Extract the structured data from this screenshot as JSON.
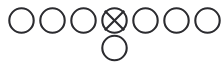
{
  "diagram": {
    "background_color": "#ffffff",
    "stroke_color": "#2b2b2f",
    "fill_color": "#ffffff",
    "stroke_width": 2.1,
    "canvas": {
      "width": 224,
      "height": 75
    },
    "layout": {
      "row_count": 2,
      "top_row_count": 7,
      "bottom_row_count": 1,
      "circle_radius": 12.2,
      "horizontal_pitch": 31,
      "top_row_center_y": 20.5,
      "bottom_row_center_y": 48,
      "first_center_x": 21.5
    },
    "nodes": [
      {
        "id": "n1",
        "label": "",
        "mark": "none",
        "row": "top",
        "index": 0,
        "cx": 21.5,
        "cy": 20.5,
        "r": 12.2
      },
      {
        "id": "n2",
        "label": "",
        "mark": "none",
        "row": "top",
        "index": 1,
        "cx": 52.5,
        "cy": 20.5,
        "r": 12.2
      },
      {
        "id": "n3",
        "label": "",
        "mark": "none",
        "row": "top",
        "index": 2,
        "cx": 83.5,
        "cy": 20.5,
        "r": 12.2
      },
      {
        "id": "n4",
        "label": "X",
        "mark": "x",
        "row": "top",
        "index": 3,
        "cx": 114.5,
        "cy": 20.5,
        "r": 12.2
      },
      {
        "id": "n5",
        "label": "",
        "mark": "none",
        "row": "top",
        "index": 4,
        "cx": 145.5,
        "cy": 20.5,
        "r": 12.2
      },
      {
        "id": "n6",
        "label": "",
        "mark": "none",
        "row": "top",
        "index": 5,
        "cx": 176.5,
        "cy": 20.5,
        "r": 12.2
      },
      {
        "id": "n7",
        "label": "",
        "mark": "none",
        "row": "top",
        "index": 6,
        "cx": 207.5,
        "cy": 20.5,
        "r": 12.2
      },
      {
        "id": "n8",
        "label": "",
        "mark": "none",
        "row": "bottom",
        "index": 0,
        "cx": 114.5,
        "cy": 48.0,
        "r": 12.2
      }
    ]
  }
}
